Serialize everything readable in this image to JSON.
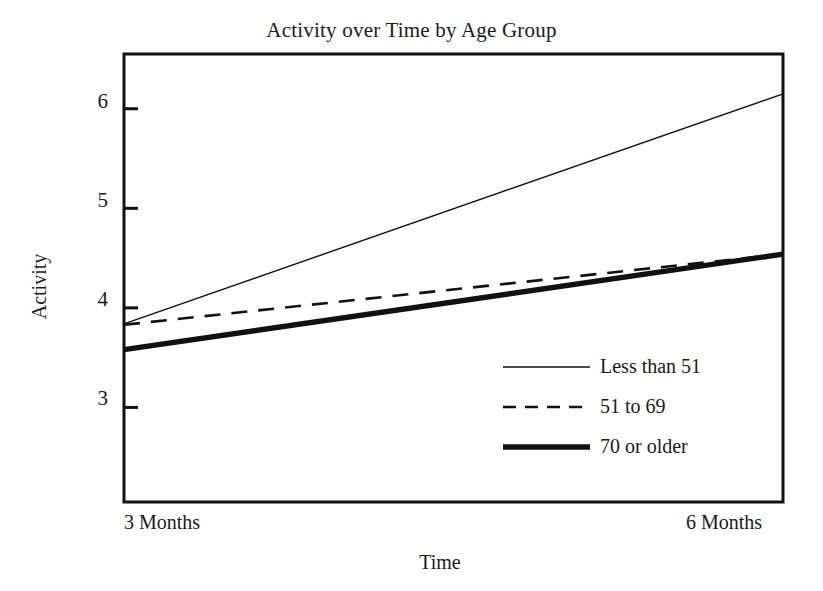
{
  "chart_data": {
    "type": "line",
    "title": "Activity over Time by Age Group",
    "xlabel": "Time",
    "ylabel": "Activity",
    "x": [
      "3 Months",
      "6 Months"
    ],
    "xtick_labels": [
      "3 Months",
      "6 Months"
    ],
    "ytick_labels": [
      "3",
      "4",
      "5",
      "6"
    ],
    "ytick_values": [
      3,
      4,
      5,
      6
    ],
    "ylim": [
      2.05,
      6.55
    ],
    "grid": false,
    "legend_position": "inside-lower-right",
    "series": [
      {
        "name": "Less than 51",
        "style": "thin-solid",
        "linewidth": 1.4,
        "values": [
          3.84,
          6.15
        ]
      },
      {
        "name": "51 to 69",
        "style": "dashed",
        "linewidth": 2.6,
        "values": [
          3.83,
          4.54
        ]
      },
      {
        "name": "70 or older",
        "style": "thick-solid",
        "linewidth": 5.4,
        "values": [
          3.58,
          4.54
        ]
      }
    ],
    "colors": {
      "background": "#ffffff",
      "axis": "#111111",
      "line": "#111111",
      "text": "#1a1a1a"
    }
  },
  "legend": {
    "entries": [
      {
        "label": "Less than 51"
      },
      {
        "label": "51 to 69"
      },
      {
        "label": "70 or older"
      }
    ]
  },
  "axes": {
    "y_ticks": [
      {
        "label": "6"
      },
      {
        "label": "5"
      },
      {
        "label": "4"
      },
      {
        "label": "3"
      }
    ],
    "x_ticks": [
      {
        "label": "3 Months"
      },
      {
        "label": "6 Months"
      }
    ]
  }
}
